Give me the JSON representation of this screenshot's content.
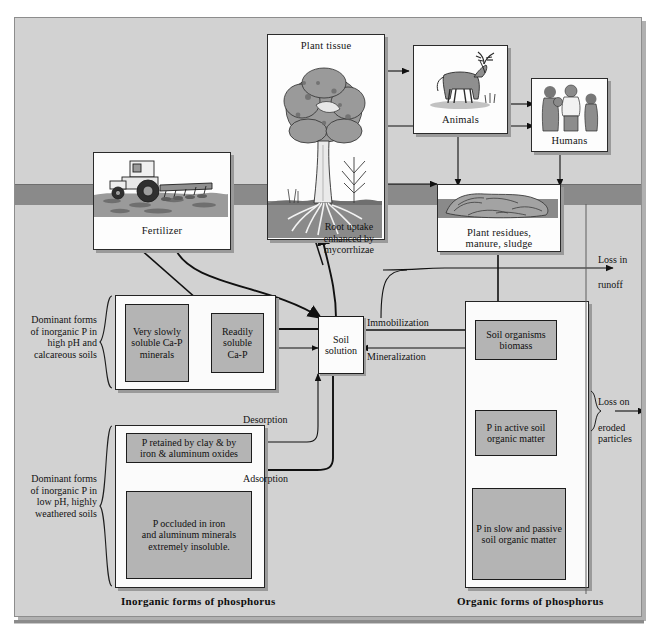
{
  "figure": {
    "soil_band_label": "soil-surface-horizon",
    "colors": {
      "background": "#d2d2d2",
      "soil_band": "#8a8a8a",
      "box_gray": "#b4b4b4",
      "box_white": "#fcfcfc",
      "line": "#101010"
    }
  },
  "photo_cards": {
    "plant_tissue": {
      "label": "Plant tissue"
    },
    "animals": {
      "label": "Animals"
    },
    "humans": {
      "label": "Humans"
    },
    "fertilizer": {
      "label": "Fertilizer"
    },
    "residues": {
      "label": "Plant residues,\nmanure, sludge",
      "line1": "Plant residues,",
      "line2": "manure, sludge"
    }
  },
  "pools": {
    "very_slowly_soluble": {
      "line1": "Very slowly",
      "line2": "soluble Ca-P",
      "line3": "minerals"
    },
    "readily_soluble": {
      "line1": "Readily",
      "line2": "soluble",
      "line3": "Ca-P"
    },
    "soil_solution": {
      "line1": "Soil",
      "line2": "solution"
    },
    "p_retained": {
      "line1": "P retained by clay & by",
      "line2": "iron & aluminum oxides"
    },
    "p_occluded": {
      "line1": "P occluded in iron",
      "line2": "and aluminum minerals",
      "line3": "extremely insoluble."
    },
    "soil_organisms": {
      "line1": "Soil organisms",
      "line2": "biomass"
    },
    "p_active": {
      "line1": "P in active soil",
      "line2": "organic matter"
    },
    "p_slow_passive": {
      "line1": "P in slow and passive",
      "line2": "soil organic matter"
    }
  },
  "flow_labels": {
    "root_uptake": {
      "line1": "Root uptake",
      "line2": "enhanced by",
      "line3": "mycorrhizae"
    },
    "immobilization": "Immobilization",
    "mineralization": "Mineralization",
    "desorption": "Desorption",
    "adsorption": "Adsorption",
    "loss_runoff": {
      "line1": "Loss in",
      "line2": "runoff"
    },
    "loss_eroded": {
      "line1": "Loss on",
      "line2": "eroded",
      "line3": "particles"
    }
  },
  "brace_labels": {
    "high_ph": {
      "line1": "Dominant forms",
      "line2": "of inorganic P in",
      "line3": "high pH and",
      "line4": "calcareous soils"
    },
    "low_ph": {
      "line1": "Dominant forms",
      "line2": "of inorganic P in",
      "line3": "low pH, highly",
      "line4": "weathered soils"
    }
  },
  "section_captions": {
    "inorganic": "Inorganic forms of phosphorus",
    "organic": "Organic forms of phosphorus"
  }
}
